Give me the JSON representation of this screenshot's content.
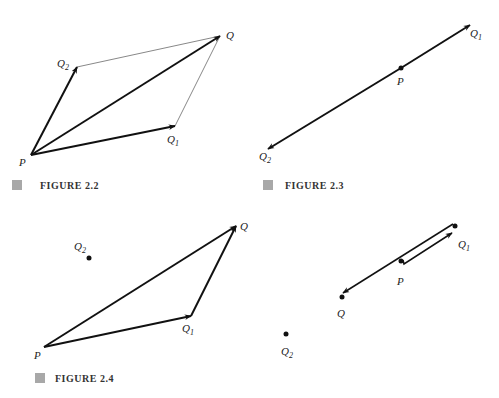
{
  "figures": [
    {
      "id": "fig22",
      "caption": "FIGURE 2.2",
      "points": {
        "P": [
          31,
          155
        ],
        "Q1": [
          175,
          126
        ],
        "Q2": [
          77,
          67
        ],
        "Q": [
          220,
          36
        ]
      },
      "labels": {
        "P": "P",
        "Q": "Q",
        "Q1": "Q",
        "Q1_sub": "1",
        "Q2": "Q",
        "Q2_sub": "2"
      },
      "arrows": [
        [
          "P",
          "Q1"
        ],
        [
          "P",
          "Q2"
        ],
        [
          "P",
          "Q"
        ]
      ],
      "thin_lines": [
        [
          "Q2",
          "Q"
        ],
        [
          "Q1",
          "Q"
        ]
      ]
    },
    {
      "id": "fig23",
      "caption": "FIGURE 2.3",
      "points": {
        "P": [
          401,
          68
        ],
        "Q1": [
          470,
          25
        ],
        "Q2": [
          268,
          149
        ]
      },
      "labels": {
        "P": "P",
        "Q1": "Q",
        "Q1_sub": "1",
        "Q2": "Q",
        "Q2_sub": "2"
      },
      "arrows": [
        [
          "P",
          "Q1"
        ],
        [
          "P",
          "Q2"
        ]
      ]
    },
    {
      "id": "fig24",
      "caption": "FIGURE 2.4",
      "points": {
        "P": [
          44,
          347
        ],
        "Q1": [
          191,
          316
        ],
        "Q": [
          236,
          226
        ],
        "Q2": [
          89,
          258
        ]
      },
      "labels": {
        "P": "P",
        "Q": "Q",
        "Q1": "Q",
        "Q1_sub": "1",
        "Q2": "Q",
        "Q2_sub": "2"
      },
      "arrows": [
        [
          "P",
          "Q1"
        ],
        [
          "Q1",
          "Q"
        ],
        [
          "P",
          "Q"
        ]
      ]
    },
    {
      "id": "fig24b",
      "caption": "",
      "points": {
        "P": [
          401,
          261
        ],
        "Q1": [
          455,
          226
        ],
        "Q": [
          342,
          297
        ],
        "Q2": [
          286,
          334
        ]
      },
      "labels": {
        "P": "P",
        "Q": "Q",
        "Q1": "Q",
        "Q1_sub": "1",
        "Q2": "Q",
        "Q2_sub": "2"
      },
      "arrows": [
        [
          "P",
          "Q1"
        ],
        [
          "Q1",
          "Q"
        ]
      ]
    }
  ],
  "colors": {
    "ink": "#111111",
    "thin": "#888888",
    "caption_box": "#a8a8a8"
  }
}
